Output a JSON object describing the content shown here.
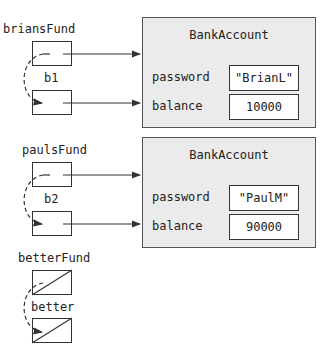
{
  "references": [
    {
      "name": "briansFund",
      "null": false
    },
    {
      "name": "b1",
      "null": false
    },
    {
      "name": "paulsFund",
      "null": false
    },
    {
      "name": "b2",
      "null": false
    },
    {
      "name": "betterFund",
      "null": true
    },
    {
      "name": "better",
      "null": true
    }
  ],
  "objects": [
    {
      "class_name": "BankAccount",
      "fields": [
        {
          "name": "password",
          "value": "\"BrianL\""
        },
        {
          "name": "balance",
          "value": "10000"
        }
      ]
    },
    {
      "class_name": "BankAccount",
      "fields": [
        {
          "name": "password",
          "value": "\"PaulM\""
        },
        {
          "name": "balance",
          "value": "90000"
        }
      ]
    }
  ],
  "colors": {
    "object_fill": "#ebebeb",
    "stroke": "#333333"
  }
}
